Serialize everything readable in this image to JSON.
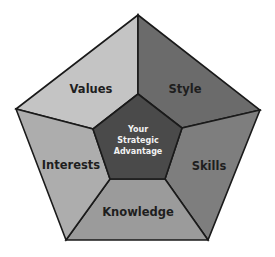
{
  "diagram": {
    "center": {
      "lines": [
        "Your",
        "Strategic",
        "Advantage"
      ],
      "color": "#4a4a4a"
    },
    "segments": [
      {
        "label": "Values",
        "color": "#c4c4c4"
      },
      {
        "label": "Style",
        "color": "#6b6b6b"
      },
      {
        "label": "Skills",
        "color": "#7e7e7e"
      },
      {
        "label": "Knowledge",
        "color": "#9b9b9b"
      },
      {
        "label": "Interests",
        "color": "#adadad"
      }
    ]
  }
}
